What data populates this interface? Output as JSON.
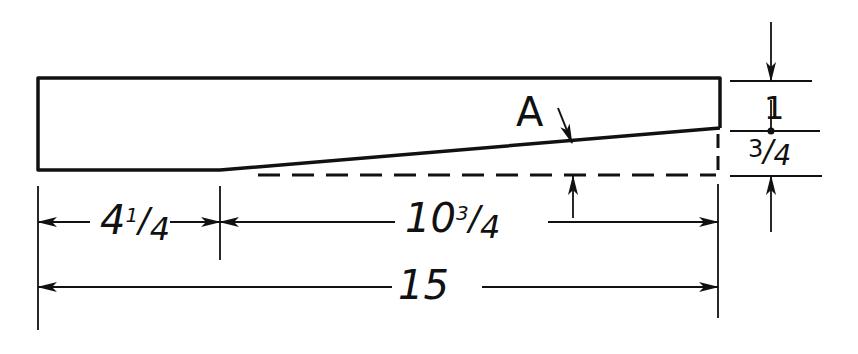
{
  "drawing": {
    "type": "tapered-bar-dimension-sketch",
    "line_color": "#111111",
    "background": "#ffffff"
  },
  "labels": {
    "feature": "A",
    "left_length": {
      "whole": "4",
      "num": "1",
      "den": "4"
    },
    "right_length": {
      "whole": "10",
      "num": "3",
      "den": "4"
    },
    "overall_length": "15",
    "end_height": "1",
    "taper_drop": {
      "num": "3",
      "den": "4"
    }
  },
  "dimensions": {
    "overall_length": 15,
    "straight_section": 4.25,
    "taper_section": 10.75,
    "right_end_height": 1,
    "taper_depth": 0.75
  }
}
